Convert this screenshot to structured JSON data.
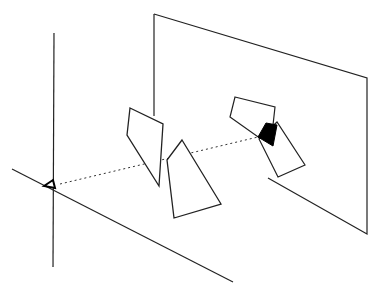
{
  "diagram": {
    "title": "",
    "colors": {
      "background": "#ffffff",
      "stroke": "#222222",
      "fill_overlap": "#000000"
    },
    "elements": {
      "vertical_axis": {
        "x1": 54,
        "y1": 33,
        "x2": 53,
        "y2": 267
      },
      "ground_axis": {
        "x1": 12,
        "y1": 169,
        "x2": 233,
        "y2": 282
      },
      "eye_marker": {
        "points": "44,186 53,180 55,188"
      },
      "image_plane": {
        "points": "154,14 367,78 367,234 268,178"
      },
      "image_plane_left_edge": {
        "x1": 154,
        "y1": 14,
        "x2": 154,
        "y2": 116
      },
      "sight_ray": {
        "x1": 60,
        "y1": 184,
        "x2": 258,
        "y2": 137
      },
      "polygon_near_left": {
        "points": "130,108 163,124 159,186 127,135"
      },
      "polygon_near_right": {
        "points": "182,140 221,204 174,218 167,160"
      },
      "projection_upper": {
        "points": "235,97 275,107 273,125 261,139 230,117"
      },
      "projection_lower": {
        "points": "259,139 277,122 305,165 278,177"
      },
      "projection_overlap": {
        "points": "266,123 277,125 273,146 258,137"
      }
    }
  }
}
